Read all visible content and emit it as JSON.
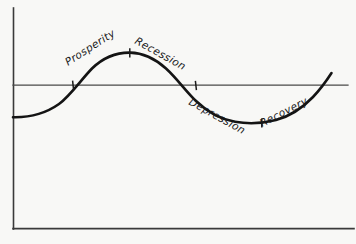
{
  "figure": {
    "background_color": "#f8f8f6",
    "ink_color": "#141414"
  },
  "chart_data": {
    "type": "line",
    "xlabel": "",
    "ylabel": "",
    "grid": false,
    "legend": "none",
    "axes": {
      "vertical_axis": {
        "x": 13,
        "y_top": 8,
        "y_bottom": 229
      },
      "horizontal_baseline": {
        "y": 85,
        "x_start": 13,
        "x_end": 348
      },
      "bottom_axis": {
        "y": 229,
        "x_start": 13,
        "x_end": 354
      },
      "xlim": [
        13,
        348
      ],
      "ylim": [
        229,
        8
      ]
    },
    "series": [
      {
        "name": "Business cycle",
        "x": [
          13,
          40,
          73,
          100,
          130,
          160,
          196,
          225,
          262,
          295,
          320,
          332
        ],
        "y": [
          117,
          113,
          85,
          62,
          53,
          60,
          85,
          108,
          122,
          112,
          86,
          74
        ],
        "description": "Sine-like wave: rises from below baseline, peaks above, falls through baseline to a trough, then recovers back above baseline"
      }
    ],
    "key_points": [
      {
        "label": "Prosperity crossing",
        "x": 73,
        "y": 85,
        "marker": "tick"
      },
      {
        "label": "Peak",
        "x": 130,
        "y": 53,
        "marker": "tick"
      },
      {
        "label": "Recession crossing",
        "x": 196,
        "y": 85,
        "marker": "tick"
      },
      {
        "label": "Trough",
        "x": 262,
        "y": 122,
        "marker": "tick"
      }
    ],
    "annotations": [
      {
        "text": "Prosperity",
        "x": 68,
        "y": 66,
        "rotation": -33
      },
      {
        "text": "Recession",
        "x": 134,
        "y": 43,
        "rotation": 29
      },
      {
        "text": "Depression",
        "x": 188,
        "y": 104,
        "rotation": 29
      },
      {
        "text": "Recovery",
        "x": 262,
        "y": 127,
        "rotation": -27
      }
    ]
  },
  "labels": {
    "prosperity": "Prosperity",
    "recession": "Recession",
    "depression": "Depression",
    "recovery": "Recovery"
  }
}
